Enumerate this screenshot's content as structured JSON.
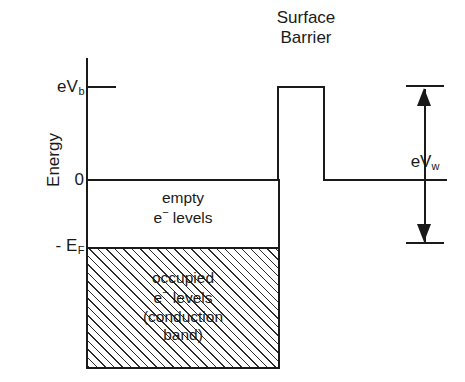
{
  "figure": {
    "type": "energy-band-diagram",
    "header_fragment": "",
    "axis": {
      "name": "Energy",
      "ticks": [
        {
          "id": "evb",
          "label": "eV",
          "sub": "b",
          "value": "eV_b"
        },
        {
          "id": "zero",
          "label": "0",
          "sub": "",
          "value": "0"
        },
        {
          "id": "ef",
          "label": "- E",
          "sub": "F",
          "value": "-E_F"
        }
      ]
    },
    "regions": [
      {
        "id": "empty",
        "lines": [
          "empty",
          "e  levels"
        ],
        "line1": "empty",
        "line2_pre": "e",
        "line2_sup": "−",
        "line2_post": " levels",
        "filled": false
      },
      {
        "id": "occupied",
        "lines": [
          "occupied",
          "e  levels",
          "(conduction",
          "band)"
        ],
        "line1": "occupied",
        "line2_pre": "e",
        "line2_sup": "−",
        "line2_post": " levels",
        "line3": "(conduction",
        "line4": "band)",
        "filled": true
      }
    ],
    "barrier": {
      "title_line1": "Surface",
      "title_line2": "Barrier",
      "top_level": "eV_b",
      "base_level": "0"
    },
    "work_function": {
      "label": "eV",
      "sub": "w",
      "value": "eV_w",
      "arrow": "double-headed-vertical"
    },
    "colors": {
      "ink": "#1a1a1a",
      "background": "#ffffff",
      "hatch": "#2b2b2b"
    }
  },
  "chart_data": {
    "type": "line",
    "title": "Surface Barrier",
    "xlabel": "",
    "ylabel": "Energy",
    "grid": false,
    "legend": null,
    "ytick_labels": [
      "eV_b",
      "0",
      "-E_F"
    ],
    "ytick_values": [
      1.0,
      0.0,
      -0.73
    ],
    "ylim": [
      -2.02,
      1.32
    ],
    "xlim": [
      0,
      100
    ],
    "series": [
      {
        "name": "potential energy profile",
        "x": [
          0,
          52,
          52,
          64,
          64,
          100
        ],
        "y": [
          0,
          0,
          1.0,
          1.0,
          0,
          0
        ],
        "description": "flat zero level inside metal, rectangular surface barrier rising to eV_b, then vacuum level back at 0"
      },
      {
        "name": "Fermi level (-E_F)",
        "x": [
          0,
          52
        ],
        "y": [
          -0.73,
          -0.73
        ],
        "description": "top of occupied conduction band"
      },
      {
        "name": "band bottom",
        "x": [
          0,
          52
        ],
        "y": [
          -2.02,
          -2.02
        ],
        "description": "bottom of hatched occupied band"
      }
    ],
    "annotations": [
      {
        "text": "empty e− levels",
        "x": 26,
        "y": -0.35
      },
      {
        "text": "occupied e− levels (conduction band)",
        "x": 26,
        "y": -1.4
      },
      {
        "text": "eV_w",
        "x": 92,
        "y": 0.18,
        "kind": "double-arrow",
        "from_y": 1.02,
        "to_y": -0.72
      },
      {
        "text": "Surface Barrier",
        "x": 58,
        "y": 1.28,
        "kind": "title"
      }
    ]
  }
}
